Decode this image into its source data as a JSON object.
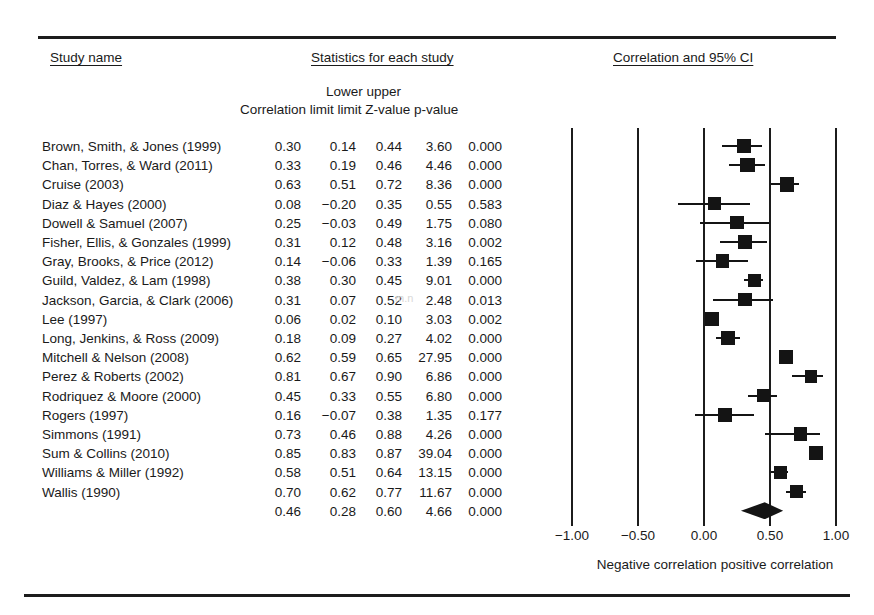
{
  "headers": {
    "study_name": "Study name",
    "statistics": "Statistics for each study",
    "plot": "Correlation and 95% CI",
    "lower_upper": "Lower upper",
    "columns_line": "Correlation limit   limit  Z-value p-value",
    "col_correlation": "Correlation",
    "col_lower_limit": "Lower limit",
    "col_upper_limit": "upper limit",
    "col_zvalue": "Z-value",
    "col_pvalue": "p-value"
  },
  "axis": {
    "caption": "Negative correlation positive correlation",
    "ticks": [
      "−1.00",
      "−0.50",
      "0.00",
      "0.50",
      "1.00"
    ],
    "tick_values": [
      -1.0,
      -0.5,
      0.0,
      0.5,
      1.0
    ]
  },
  "chart_data": {
    "type": "forest",
    "title": "Correlation and 95% CI",
    "xlabel": "Negative correlation positive correlation",
    "ylabel": "",
    "xlim": [
      -1.0,
      1.0
    ],
    "xticks": [
      -1.0,
      -0.5,
      0.0,
      0.5,
      1.0
    ],
    "xticklabels": [
      "−1.00",
      "−0.50",
      "0.00",
      "0.50",
      "1.00"
    ],
    "grid": true,
    "legend": "none",
    "effect_measure": "Correlation",
    "columns": [
      "Study name",
      "Correlation",
      "Lower limit",
      "upper limit",
      "Z-value",
      "p-value"
    ],
    "rows": [
      {
        "study": "Brown, Smith, & Jones (1999)",
        "correlation": 0.3,
        "lower": 0.14,
        "upper": 0.44,
        "z": 3.6,
        "p": "0.000",
        "weight": 0.55
      },
      {
        "study": "Chan, Torres, & Ward (2011)",
        "correlation": 0.33,
        "lower": 0.19,
        "upper": 0.46,
        "z": 4.46,
        "p": "0.000",
        "weight": 0.6
      },
      {
        "study": "Cruise (2003)",
        "correlation": 0.63,
        "lower": 0.51,
        "upper": 0.72,
        "z": 8.36,
        "p": "0.000",
        "weight": 0.6
      },
      {
        "study": "Diaz & Hayes (2000)",
        "correlation": 0.08,
        "lower": -0.2,
        "upper": 0.35,
        "z": 0.55,
        "p": "0.583",
        "weight": 0.45
      },
      {
        "study": "Dowell & Samuel (2007)",
        "correlation": 0.25,
        "lower": -0.03,
        "upper": 0.49,
        "z": 1.75,
        "p": "0.080",
        "weight": 0.45
      },
      {
        "study": "Fisher, Ellis, & Gonzales (1999)",
        "correlation": 0.31,
        "lower": 0.12,
        "upper": 0.48,
        "z": 3.16,
        "p": "0.002",
        "weight": 0.52
      },
      {
        "study": "Gray, Brooks, & Price (2012)",
        "correlation": 0.14,
        "lower": -0.06,
        "upper": 0.33,
        "z": 1.39,
        "p": "0.165",
        "weight": 0.52
      },
      {
        "study": "Guild, Valdez, & Lam (1998)",
        "correlation": 0.38,
        "lower": 0.3,
        "upper": 0.45,
        "z": 9.01,
        "p": "0.000",
        "weight": 0.44
      },
      {
        "study": "Jackson, Garcia, & Clark (2006)",
        "correlation": 0.31,
        "lower": 0.07,
        "upper": 0.52,
        "z": 2.48,
        "p": "0.013",
        "weight": 0.52
      },
      {
        "study": "Lee (1997)",
        "correlation": 0.06,
        "lower": 0.02,
        "upper": 0.1,
        "z": 3.03,
        "p": "0.002",
        "weight": 0.62
      },
      {
        "study": "Long, Jenkins, & Ross (2009)",
        "correlation": 0.18,
        "lower": 0.09,
        "upper": 0.27,
        "z": 4.02,
        "p": "0.000",
        "weight": 0.5
      },
      {
        "study": "Mitchell & Nelson (2008)",
        "correlation": 0.62,
        "lower": 0.59,
        "upper": 0.65,
        "z": 27.95,
        "p": "0.000",
        "weight": 0.52
      },
      {
        "study": "Perez & Roberts (2002)",
        "correlation": 0.81,
        "lower": 0.67,
        "upper": 0.9,
        "z": 6.86,
        "p": "0.000",
        "weight": 0.42
      },
      {
        "study": "Rodriquez & Moore (2000)",
        "correlation": 0.45,
        "lower": 0.33,
        "upper": 0.55,
        "z": 6.8,
        "p": "0.000",
        "weight": 0.5
      },
      {
        "study": "Rogers (1997)",
        "correlation": 0.16,
        "lower": -0.07,
        "upper": 0.38,
        "z": 1.35,
        "p": "0.177",
        "weight": 0.5
      },
      {
        "study": "Simmons (1991)",
        "correlation": 0.73,
        "lower": 0.46,
        "upper": 0.88,
        "z": 4.26,
        "p": "0.000",
        "weight": 0.52
      },
      {
        "study": "Sum & Collins (2010)",
        "correlation": 0.85,
        "lower": 0.83,
        "upper": 0.87,
        "z": 39.04,
        "p": "0.000",
        "weight": 0.55
      },
      {
        "study": "Williams & Miller (1992)",
        "correlation": 0.58,
        "lower": 0.51,
        "upper": 0.64,
        "z": 13.15,
        "p": "0.000",
        "weight": 0.5
      },
      {
        "study": "Wallis (1990)",
        "correlation": 0.7,
        "lower": 0.62,
        "upper": 0.77,
        "z": 11.67,
        "p": "0.000",
        "weight": 0.48
      }
    ],
    "summary": {
      "study": "",
      "correlation": 0.46,
      "lower": 0.28,
      "upper": 0.6,
      "z": 4.66,
      "p": "0.000"
    }
  },
  "colors": {
    "marker": "#141414",
    "rule": "#1c1c1c",
    "text": "#1a1a1a"
  }
}
